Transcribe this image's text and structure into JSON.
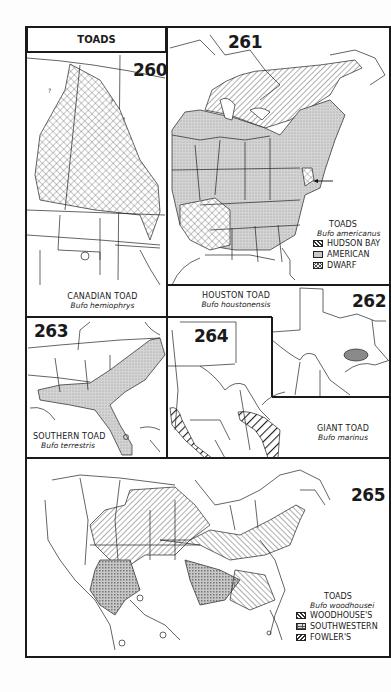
{
  "page": {
    "title": "TOADS"
  },
  "maps": [
    {
      "number": "260",
      "common_name": "CANADIAN TOAD",
      "scientific_name": "Bufo hemiophrys",
      "region": "Northern Great Plains and central Canada"
    },
    {
      "number": "261",
      "legend_title": "TOADS",
      "legend_scientific": "Bufo americanus",
      "legend": [
        {
          "label": "HUDSON BAY",
          "pattern": "diagonal-hatch"
        },
        {
          "label": "AMERICAN",
          "pattern": "stipple"
        },
        {
          "label": "DWARF",
          "pattern": "crosshatch"
        }
      ],
      "annotation": "arrow pointing west toward Chesapeake region"
    },
    {
      "number": "262",
      "common_name": "HOUSTON TOAD",
      "scientific_name": "Bufo houstonensis",
      "region": "Texas (small area in east-central Texas)"
    },
    {
      "number": "263",
      "common_name": "SOUTHERN TOAD",
      "scientific_name": "Bufo terrestris",
      "region": "Southeastern coastal plain"
    },
    {
      "number": "264",
      "common_name": "GIANT TOAD",
      "scientific_name": "Bufo marinus",
      "region": "South Texas and Mexico coasts"
    },
    {
      "number": "265",
      "legend_title": "TOADS",
      "legend_scientific": "Bufo woodhousei",
      "legend": [
        {
          "label": "WOODHOUSE'S",
          "pattern": "diagonal-hatch"
        },
        {
          "label": "SOUTHWESTERN",
          "pattern": "grid"
        },
        {
          "label": "FOWLER'S",
          "pattern": "reverse-diagonal-hatch"
        }
      ]
    }
  ],
  "colors": {
    "ink": "#1a1a1a",
    "paper": "#ffffff",
    "stipple_fill": "#cfcfcf",
    "houston_fill": "#8a8a8a"
  }
}
